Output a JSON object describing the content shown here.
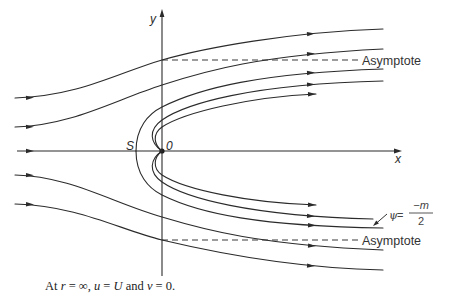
{
  "figure": {
    "axes": {
      "x_label": "x",
      "y_label": "y"
    },
    "points": {
      "stagnation_label": "S",
      "origin_label": "0"
    },
    "asymptote_labels": {
      "upper": "Asymptote",
      "lower": "Asymptote"
    },
    "streamline_label": {
      "psi": "ψ",
      "equals": "=",
      "numerator": "−m",
      "denominator": "2"
    },
    "caption": {
      "p1": "At ",
      "r": "r",
      "p2": " = ∞, ",
      "u": "u",
      "p3": " = ",
      "U": "U",
      "p4": " and ",
      "v": "v",
      "p5": " = 0."
    }
  },
  "colors": {
    "line": "#2b2b2b",
    "background": "#ffffff"
  }
}
